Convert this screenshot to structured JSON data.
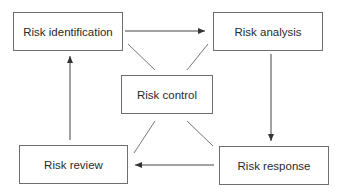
{
  "diagram": {
    "type": "cycle",
    "colors": {
      "line": "#6e6e6e",
      "arrow": "#333333",
      "text": "#2a2a2a",
      "background": "#ffffff"
    },
    "nodes": [
      {
        "id": "identification",
        "label": "Risk identification"
      },
      {
        "id": "analysis",
        "label": "Risk analysis"
      },
      {
        "id": "control",
        "label": "Risk control"
      },
      {
        "id": "review",
        "label": "Risk review"
      },
      {
        "id": "response",
        "label": "Risk response"
      }
    ],
    "edges": [
      {
        "from": "identification",
        "to": "analysis",
        "directed": true
      },
      {
        "from": "analysis",
        "to": "response",
        "directed": true
      },
      {
        "from": "response",
        "to": "review",
        "directed": true
      },
      {
        "from": "review",
        "to": "identification",
        "directed": true
      },
      {
        "from": "control",
        "to": "identification",
        "directed": false
      },
      {
        "from": "control",
        "to": "analysis",
        "directed": false
      },
      {
        "from": "control",
        "to": "review",
        "directed": false
      },
      {
        "from": "control",
        "to": "response",
        "directed": false
      }
    ]
  }
}
